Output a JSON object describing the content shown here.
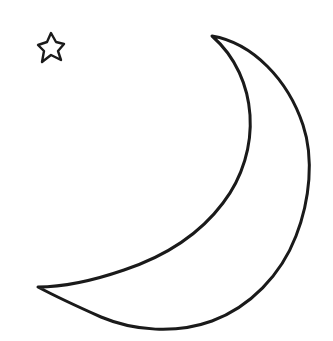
{
  "canvas": {
    "width": 333,
    "height": 341,
    "background_color": "#ffffff",
    "ink_color": "#1a1a1a"
  },
  "artwork": {
    "title": "Crescent Moon and Star Outline",
    "style": "line-art coloring page",
    "stroke_width_px": 3,
    "shapes": [
      {
        "name": "crescent-moon",
        "role": "primary figure",
        "fill": "#ffffff",
        "stroke": "#1a1a1a",
        "stroke_width_px": 3,
        "bounds": {
          "x": 36,
          "y": 34,
          "width": 275,
          "height": 296
        },
        "key_points": {
          "upper_tip": [
            212,
            36
          ],
          "lower_tip": [
            38,
            287
          ],
          "rightmost": [
            309,
            175
          ],
          "bottommost": [
            180,
            328
          ]
        },
        "path": "M 212 36 C 253 43, 288 80, 303 125 C 314 158, 310 200, 296 236 C 281 275, 250 307, 212 321 C 176 334, 134 331, 101 317 C 74 305, 53 295, 38 287 C 60 287, 92 281, 124 270 C 163 257, 199 235, 223 203 C 243 177, 252 145, 250 115 C 248 86, 236 57, 212 36 Z"
      },
      {
        "name": "five-pointed-star",
        "role": "secondary figure",
        "fill": "#ffffff",
        "stroke": "#1a1a1a",
        "stroke_width_px": 2.4,
        "bounds": {
          "x": 38,
          "y": 33,
          "width": 26,
          "height": 29
        },
        "key_points": {
          "top_point": [
            51,
            33
          ],
          "left_point": [
            38,
            45
          ],
          "right_point": [
            64,
            44
          ],
          "bottom_left_point": [
            42,
            62
          ],
          "bottom_right_point": [
            61,
            60
          ]
        },
        "path": "M 51 33 L 56 42 L 64 44 L 58 51 L 61 60 L 51 55 L 42 62 L 44 51 L 38 45 L 47 42 Z"
      }
    ]
  },
  "labels": {
    "figure_caption": "Crescent moon with a small star outline drawing"
  }
}
